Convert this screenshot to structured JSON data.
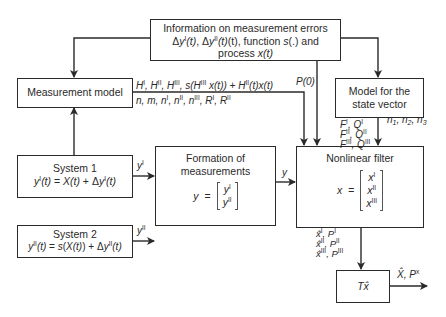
{
  "diagram": {
    "type": "block-diagram",
    "blocks": {
      "info": {
        "line1": "Information on measurement errors",
        "line2_parts": [
          "Δy",
          "I",
          "(t), Δy",
          "II",
          "(t), function ",
          "s",
          "(.) and"
        ],
        "line3_parts": [
          "process ",
          "x(t)"
        ]
      },
      "measurement_model": {
        "label": "Measurement model"
      },
      "system1": {
        "title": "System 1",
        "equation": "y^I(t) = X(t) + Δy^I(t)"
      },
      "system2": {
        "title": "System 2",
        "equation": "y^II(t) = s(X(t)) + Δy^II(t)"
      },
      "formation": {
        "title_line1": "Formation of",
        "title_line2": "measurements",
        "lhs": "y",
        "eq": "=",
        "entries": [
          "y^I",
          "y^II"
        ]
      },
      "state_model": {
        "line1": "Model for the",
        "line2": "state vector"
      },
      "filter": {
        "title": "Nonlinear filter",
        "lhs": "x",
        "eq": "=",
        "entries": [
          "x^I",
          "x^II",
          "x^III"
        ]
      },
      "transform": {
        "label": "Tx̂"
      }
    },
    "edge_labels": {
      "H_line": "H^I, H^II, H^III, s(H^III x(t)) + H^II(t)x(t)",
      "n_line": "n, m, n^I, n^II, n^III, R^I, R^II",
      "P0": "P(0)",
      "FQ": [
        "F^I, Q^I",
        "F^II, Q^II",
        "F^III, Q^III"
      ],
      "n123": "n1, n2, n3",
      "yI": "y^I",
      "yII": "y^II",
      "y": "y",
      "estimates": [
        "x̂^I, P^I",
        "x̂^II, P^II",
        "x̂^III, P^III"
      ],
      "output": "X̂, P^x"
    },
    "edges": [
      {
        "from": "info",
        "to": "measurement_model"
      },
      {
        "from": "info",
        "to": "filter",
        "label": "P(0)"
      },
      {
        "from": "info",
        "to": "state_model"
      },
      {
        "from": "measurement_model",
        "to": "filter"
      },
      {
        "from": "system1",
        "to": "measurement_model"
      },
      {
        "from": "system1",
        "to": "formation",
        "label": "y^I"
      },
      {
        "from": "system2",
        "to": "formation",
        "label": "y^II"
      },
      {
        "from": "formation",
        "to": "filter",
        "label": "y"
      },
      {
        "from": "state_model",
        "to": "filter"
      },
      {
        "from": "filter",
        "to": "transform"
      },
      {
        "from": "transform",
        "to": "output",
        "label": "X̂, P^x"
      }
    ],
    "text": {
      "delta": "Δ",
      "y": "y",
      "x": "x",
      "X": "X",
      "t": "(t)",
      "s": "s",
      "H": "H",
      "I": "I",
      "II": "II",
      "III": "III",
      "P": "P",
      "F": "F",
      "Q": "Q",
      "R": "R",
      "n": "n",
      "m": "m",
      "xhat": "x̂",
      "Xhat": "X̂",
      "Tx": "Tx̂",
      "sx": "s(",
      "close": ")",
      "comma": ", ",
      "eq": " = ",
      "plus": " + ",
      "P0": "P(0)",
      "n1": "1",
      "n2": "2",
      "n3": "3",
      "xsup": "x"
    }
  }
}
